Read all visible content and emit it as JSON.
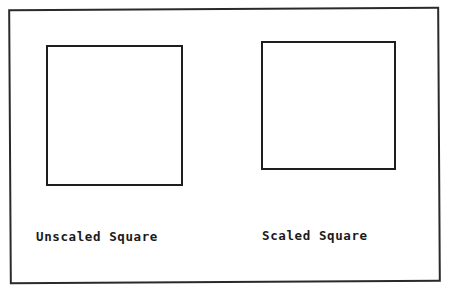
{
  "diagram": {
    "frame": {
      "border_color": "#2a2a2a"
    },
    "shapes": [
      {
        "id": "unscaled",
        "kind": "square",
        "label": "Unscaled Square"
      },
      {
        "id": "scaled",
        "kind": "square",
        "label": "Scaled Square"
      }
    ]
  }
}
